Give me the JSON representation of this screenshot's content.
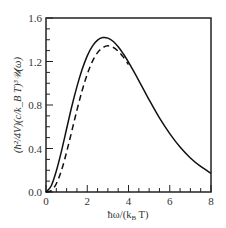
{
  "chart_data": {
    "type": "line",
    "title": "",
    "xlabel": "ħω/(k_B T)",
    "ylabel": "(ħ²/4V)(c/k_B T)³𝒰(ω)",
    "xlim": [
      0,
      8
    ],
    "ylim": [
      0,
      1.6
    ],
    "x_ticks": [
      0,
      2,
      4,
      6,
      8
    ],
    "x_tick_labels": [
      "0",
      "2",
      "4",
      "6",
      "8"
    ],
    "y_ticks": [
      0.0,
      0.4,
      0.8,
      1.2,
      1.6
    ],
    "y_tick_labels": [
      "0.0",
      "0.4",
      "0.8",
      "1.2",
      "1.6"
    ],
    "x_minor_step": 0.5,
    "y_minor_step": 0.1,
    "grid": false,
    "legend": null,
    "series": [
      {
        "name": "solid",
        "style": "solid",
        "x": [
          0,
          0.25,
          0.5,
          0.75,
          1,
          1.25,
          1.5,
          1.75,
          2,
          2.25,
          2.5,
          2.75,
          3,
          3.25,
          3.5,
          3.75,
          4,
          4.5,
          5,
          5.5,
          6,
          6.5,
          7,
          7.5,
          8
        ],
        "values": [
          0,
          0.055,
          0.193,
          0.376,
          0.582,
          0.786,
          0.969,
          1.126,
          1.252,
          1.342,
          1.397,
          1.42,
          1.415,
          1.386,
          1.335,
          1.27,
          1.194,
          1.025,
          0.848,
          0.681,
          0.537,
          0.413,
          0.313,
          0.235,
          0.172
        ]
      },
      {
        "name": "dashed",
        "style": "dashed",
        "x": [
          0,
          0.25,
          0.5,
          0.75,
          1,
          1.25,
          1.5,
          1.75,
          2,
          2.25,
          2.5,
          2.75,
          3,
          3.25,
          3.5,
          3.75,
          4
        ],
        "values": [
          0,
          0.012,
          0.076,
          0.199,
          0.368,
          0.559,
          0.753,
          0.931,
          1.083,
          1.201,
          1.282,
          1.327,
          1.344,
          1.331,
          1.294,
          1.24,
          1.172
        ]
      }
    ]
  },
  "labels": {
    "x_axis": "ħω/(k",
    "x_axis_sub": "B",
    "x_axis_end": " T)",
    "y_axis": "(ħ²/4V)(c/k_B T)³𝒰(ω)"
  }
}
